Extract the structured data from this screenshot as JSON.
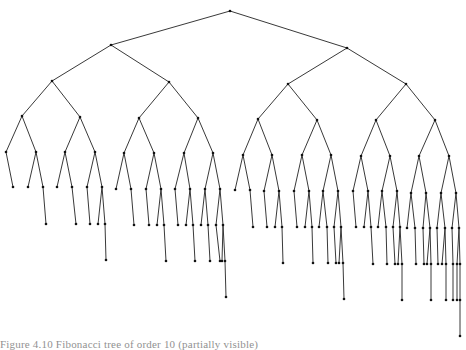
{
  "diagram": {
    "type": "binary-tree",
    "edge_color": "#222222",
    "node_color": "#111111",
    "nodes": {
      "r": [
        230,
        11
      ],
      "L": [
        111,
        45
      ],
      "R": [
        347,
        48
      ],
      "LL": [
        52,
        81
      ],
      "LR": [
        169,
        82
      ],
      "RL": [
        288,
        84
      ],
      "RR": [
        406,
        84
      ],
      "a1": [
        22,
        116
      ],
      "a2": [
        80,
        117
      ],
      "a3": [
        139,
        118
      ],
      "a4": [
        198,
        118
      ],
      "a5": [
        258,
        119
      ],
      "a6": [
        317,
        120
      ],
      "a7": [
        376,
        120
      ],
      "a8": [
        435,
        120
      ],
      "b1": [
        6,
        152
      ],
      "b2": [
        36,
        152
      ],
      "b3": [
        65,
        152
      ],
      "b4": [
        95,
        152
      ],
      "b5": [
        124,
        153
      ],
      "b6": [
        154,
        153
      ],
      "b7": [
        184,
        153
      ],
      "b8": [
        213,
        153
      ],
      "b9": [
        243,
        155
      ],
      "b10": [
        272,
        155
      ],
      "b11": [
        302,
        155
      ],
      "b12": [
        331,
        155
      ],
      "b13": [
        361,
        156
      ],
      "b14": [
        390,
        156
      ],
      "b15": [
        419,
        156
      ],
      "b16": [
        449,
        156
      ],
      "c1": [
        13,
        187
      ],
      "c2": [
        28,
        187
      ],
      "c3": [
        43,
        187
      ],
      "c4": [
        57,
        187
      ],
      "c5": [
        72,
        187
      ],
      "c6": [
        87,
        187
      ],
      "c7": [
        102,
        187
      ],
      "c8": [
        116,
        189
      ],
      "c9": [
        131,
        189
      ],
      "c10": [
        146,
        189
      ],
      "c11": [
        161,
        189
      ],
      "c12": [
        175,
        189
      ],
      "c13": [
        190,
        189
      ],
      "c14": [
        205,
        189
      ],
      "c15": [
        220,
        189
      ],
      "c16": [
        235,
        190
      ],
      "c17": [
        250,
        190
      ],
      "c18": [
        264,
        191
      ],
      "c19": [
        279,
        191
      ],
      "c20": [
        294,
        191
      ],
      "c21": [
        309,
        191
      ],
      "c22": [
        323,
        191
      ],
      "c23": [
        338,
        191
      ],
      "c24": [
        353,
        191
      ],
      "c25": [
        368,
        191
      ],
      "c26": [
        382,
        191
      ],
      "c27": [
        397,
        191
      ],
      "c28": [
        411,
        193
      ],
      "c29": [
        426,
        193
      ],
      "c30": [
        441,
        193
      ],
      "c31": [
        456,
        193
      ],
      "d1": [
        46,
        224
      ],
      "d2": [
        76,
        224
      ],
      "d3": [
        90,
        224
      ],
      "d4": [
        98,
        224
      ],
      "d5": [
        105,
        224
      ],
      "d6": [
        134,
        225
      ],
      "d7": [
        149,
        225
      ],
      "d8": [
        157,
        225
      ],
      "d9": [
        164,
        225
      ],
      "d10": [
        178,
        225
      ],
      "d11": [
        186,
        225
      ],
      "d12": [
        193,
        225
      ],
      "d13": [
        201,
        225
      ],
      "d14": [
        208,
        225
      ],
      "d15": [
        216,
        225
      ],
      "d16": [
        223,
        225
      ],
      "d17": [
        253,
        227
      ],
      "d18": [
        267,
        227
      ],
      "d19": [
        275,
        227
      ],
      "d20": [
        282,
        227
      ],
      "d21": [
        297,
        227
      ],
      "d22": [
        305,
        227
      ],
      "d23": [
        312,
        227
      ],
      "d24": [
        319,
        227
      ],
      "d25": [
        327,
        227
      ],
      "d26": [
        334,
        227
      ],
      "d27": [
        341,
        227
      ],
      "d28": [
        356,
        227
      ],
      "d29": [
        364,
        227
      ],
      "d30": [
        371,
        227
      ],
      "d31": [
        378,
        227
      ],
      "d32": [
        386,
        227
      ],
      "d33": [
        393,
        227
      ],
      "d34": [
        400,
        227
      ],
      "d35": [
        407,
        228
      ],
      "d36": [
        415,
        228
      ],
      "d37": [
        423,
        228
      ],
      "d38": [
        430,
        228
      ],
      "d39": [
        437,
        228
      ],
      "d40": [
        445,
        228
      ],
      "d41": [
        452,
        228
      ],
      "d42": [
        459,
        228
      ],
      "e1": [
        106,
        260
      ],
      "e2": [
        166,
        261
      ],
      "e3": [
        195,
        261
      ],
      "e4": [
        210,
        261
      ],
      "e5": [
        220,
        261
      ],
      "e6": [
        222,
        261
      ],
      "e7": [
        225,
        261
      ],
      "e8": [
        283,
        263
      ],
      "e9": [
        313,
        263
      ],
      "e10": [
        328,
        263
      ],
      "e11": [
        336,
        263
      ],
      "e12": [
        339,
        263
      ],
      "e13": [
        343,
        263
      ],
      "e14": [
        373,
        264
      ],
      "e15": [
        387,
        264
      ],
      "e16": [
        395,
        264
      ],
      "e17": [
        398,
        264
      ],
      "e18": [
        402,
        264
      ],
      "e19": [
        416,
        264
      ],
      "e20": [
        424,
        264
      ],
      "e21": [
        427,
        264
      ],
      "e22": [
        431,
        264
      ],
      "e23": [
        438,
        264
      ],
      "e24": [
        442,
        264
      ],
      "e25": [
        446,
        264
      ],
      "e26": [
        453,
        264
      ],
      "e27": [
        457,
        264
      ],
      "e28": [
        460,
        264
      ],
      "f1": [
        226,
        297
      ],
      "f2": [
        344,
        299
      ],
      "f3": [
        402,
        300
      ],
      "f4": [
        431,
        300
      ],
      "f5": [
        446,
        300
      ],
      "f6": [
        453,
        300
      ],
      "f7": [
        457,
        300
      ],
      "f8": [
        460,
        300
      ],
      "g1": [
        460,
        336
      ]
    },
    "edges": [
      [
        "r",
        "L"
      ],
      [
        "r",
        "R"
      ],
      [
        "L",
        "LL"
      ],
      [
        "L",
        "LR"
      ],
      [
        "R",
        "RL"
      ],
      [
        "R",
        "RR"
      ],
      [
        "LL",
        "a1"
      ],
      [
        "LL",
        "a2"
      ],
      [
        "LR",
        "a3"
      ],
      [
        "LR",
        "a4"
      ],
      [
        "RL",
        "a5"
      ],
      [
        "RL",
        "a6"
      ],
      [
        "RR",
        "a7"
      ],
      [
        "RR",
        "a8"
      ],
      [
        "a1",
        "b1"
      ],
      [
        "a1",
        "b2"
      ],
      [
        "a2",
        "b3"
      ],
      [
        "a2",
        "b4"
      ],
      [
        "a3",
        "b5"
      ],
      [
        "a3",
        "b6"
      ],
      [
        "a4",
        "b7"
      ],
      [
        "a4",
        "b8"
      ],
      [
        "a5",
        "b9"
      ],
      [
        "a5",
        "b10"
      ],
      [
        "a6",
        "b11"
      ],
      [
        "a6",
        "b12"
      ],
      [
        "a7",
        "b13"
      ],
      [
        "a7",
        "b14"
      ],
      [
        "a8",
        "b15"
      ],
      [
        "a8",
        "b16"
      ],
      [
        "b1",
        "c1"
      ],
      [
        "b2",
        "c2"
      ],
      [
        "b2",
        "c3"
      ],
      [
        "b3",
        "c4"
      ],
      [
        "b3",
        "c5"
      ],
      [
        "b4",
        "c6"
      ],
      [
        "b4",
        "c7"
      ],
      [
        "b5",
        "c8"
      ],
      [
        "b5",
        "c9"
      ],
      [
        "b6",
        "c10"
      ],
      [
        "b6",
        "c11"
      ],
      [
        "b7",
        "c12"
      ],
      [
        "b7",
        "c13"
      ],
      [
        "b8",
        "c14"
      ],
      [
        "b8",
        "c15"
      ],
      [
        "b9",
        "c16"
      ],
      [
        "b9",
        "c17"
      ],
      [
        "b10",
        "c18"
      ],
      [
        "b10",
        "c19"
      ],
      [
        "b11",
        "c20"
      ],
      [
        "b11",
        "c21"
      ],
      [
        "b12",
        "c22"
      ],
      [
        "b12",
        "c23"
      ],
      [
        "b13",
        "c24"
      ],
      [
        "b13",
        "c25"
      ],
      [
        "b14",
        "c26"
      ],
      [
        "b14",
        "c27"
      ],
      [
        "b15",
        "c28"
      ],
      [
        "b15",
        "c29"
      ],
      [
        "b16",
        "c30"
      ],
      [
        "b16",
        "c31"
      ],
      [
        "c3",
        "d1"
      ],
      [
        "c5",
        "d2"
      ],
      [
        "c6",
        "d3"
      ],
      [
        "c7",
        "d4"
      ],
      [
        "c7",
        "d5"
      ],
      [
        "c9",
        "d6"
      ],
      [
        "c10",
        "d7"
      ],
      [
        "c11",
        "d8"
      ],
      [
        "c11",
        "d9"
      ],
      [
        "c12",
        "d10"
      ],
      [
        "c13",
        "d11"
      ],
      [
        "c13",
        "d12"
      ],
      [
        "c14",
        "d13"
      ],
      [
        "c14",
        "d14"
      ],
      [
        "c15",
        "d15"
      ],
      [
        "c15",
        "d16"
      ],
      [
        "c17",
        "d17"
      ],
      [
        "c18",
        "d18"
      ],
      [
        "c19",
        "d19"
      ],
      [
        "c19",
        "d20"
      ],
      [
        "c20",
        "d21"
      ],
      [
        "c21",
        "d22"
      ],
      [
        "c21",
        "d23"
      ],
      [
        "c22",
        "d24"
      ],
      [
        "c22",
        "d25"
      ],
      [
        "c23",
        "d26"
      ],
      [
        "c23",
        "d27"
      ],
      [
        "c24",
        "d28"
      ],
      [
        "c25",
        "d29"
      ],
      [
        "c25",
        "d30"
      ],
      [
        "c26",
        "d31"
      ],
      [
        "c26",
        "d32"
      ],
      [
        "c27",
        "d33"
      ],
      [
        "c27",
        "d34"
      ],
      [
        "c28",
        "d35"
      ],
      [
        "c28",
        "d36"
      ],
      [
        "c29",
        "d37"
      ],
      [
        "c29",
        "d38"
      ],
      [
        "c30",
        "d39"
      ],
      [
        "c30",
        "d40"
      ],
      [
        "c31",
        "d41"
      ],
      [
        "c31",
        "d42"
      ],
      [
        "d5",
        "e1"
      ],
      [
        "d9",
        "e2"
      ],
      [
        "d12",
        "e3"
      ],
      [
        "d14",
        "e4"
      ],
      [
        "d15",
        "e5"
      ],
      [
        "d16",
        "e6"
      ],
      [
        "d16",
        "e7"
      ],
      [
        "d20",
        "e8"
      ],
      [
        "d23",
        "e9"
      ],
      [
        "d25",
        "e10"
      ],
      [
        "d26",
        "e11"
      ],
      [
        "d27",
        "e12"
      ],
      [
        "d27",
        "e13"
      ],
      [
        "d30",
        "e14"
      ],
      [
        "d32",
        "e15"
      ],
      [
        "d33",
        "e16"
      ],
      [
        "d34",
        "e17"
      ],
      [
        "d34",
        "e18"
      ],
      [
        "d36",
        "e19"
      ],
      [
        "d37",
        "e20"
      ],
      [
        "d38",
        "e21"
      ],
      [
        "d38",
        "e22"
      ],
      [
        "d39",
        "e23"
      ],
      [
        "d40",
        "e24"
      ],
      [
        "d40",
        "e25"
      ],
      [
        "d41",
        "e26"
      ],
      [
        "d42",
        "e27"
      ],
      [
        "d42",
        "e28"
      ],
      [
        "e7",
        "f1"
      ],
      [
        "e13",
        "f2"
      ],
      [
        "e18",
        "f3"
      ],
      [
        "e22",
        "f4"
      ],
      [
        "e25",
        "f5"
      ],
      [
        "e26",
        "f6"
      ],
      [
        "e27",
        "f7"
      ],
      [
        "e28",
        "f8"
      ],
      [
        "f8",
        "g1"
      ]
    ]
  },
  "caption": {
    "text": "Figure 4.10   Fibonacci tree of order 10 (partially visible)"
  }
}
